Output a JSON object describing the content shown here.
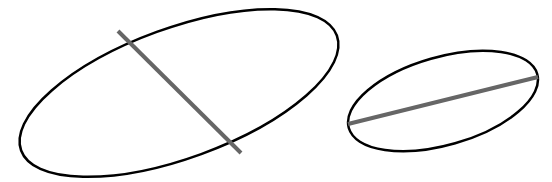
{
  "diagram": {
    "background": "#ffffff",
    "outline_color": "#000000",
    "axis_color": "#666666",
    "shapes": [
      {
        "id": "large-ellipse",
        "type": "ellipse",
        "cx": 179,
        "cy": 93,
        "rx": 168,
        "ry": 65,
        "rotation": -20,
        "stroke_width": 2.5,
        "axis_line": {
          "x1": 118,
          "y1": 31,
          "x2": 241,
          "y2": 153,
          "stroke_width": 4
        }
      },
      {
        "id": "small-ellipse",
        "type": "ellipse",
        "cx": 443,
        "cy": 101,
        "rx": 98,
        "ry": 44,
        "rotation": -16,
        "stroke_width": 2.5,
        "axis_line": {
          "x1": 348,
          "y1": 124,
          "x2": 538,
          "y2": 77,
          "stroke_width": 4
        }
      }
    ]
  }
}
